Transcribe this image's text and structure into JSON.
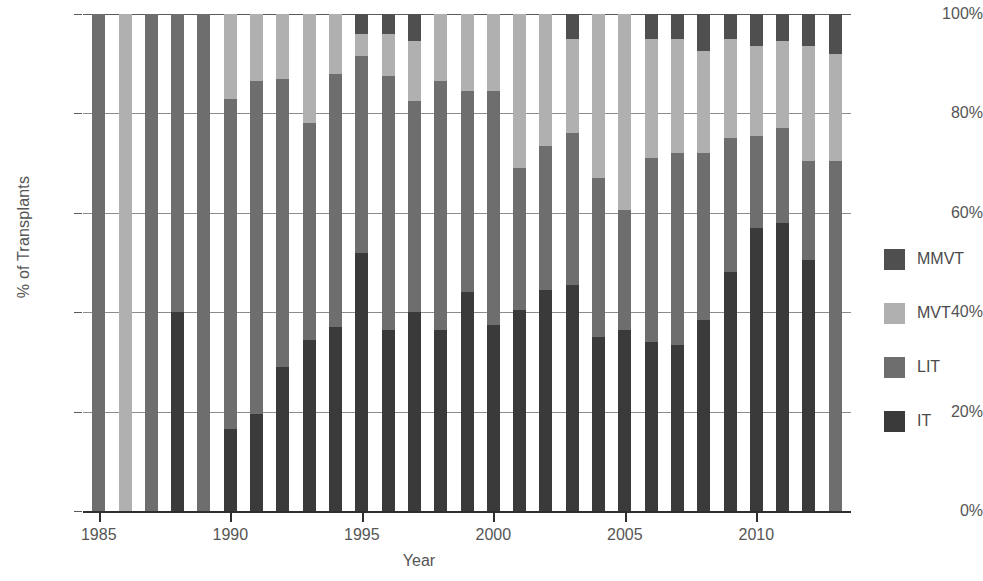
{
  "chart_data": {
    "type": "bar",
    "subtype": "stacked-percentage",
    "title": "",
    "xlabel": "Year",
    "ylabel": "% of Transplants",
    "ylim": [
      0,
      100
    ],
    "yticks": [
      0,
      20,
      40,
      60,
      80,
      100
    ],
    "ytick_labels": [
      "0%",
      "20%",
      "40%",
      "60%",
      "80%",
      "100%"
    ],
    "xticks": [
      1985,
      1990,
      1995,
      2000,
      2005,
      2010
    ],
    "xtick_labels": [
      "1985",
      "1990",
      "1995",
      "2000",
      "2005",
      "2010"
    ],
    "xlim": [
      1984.4,
      1913.0
    ],
    "x_range": [
      1984.4,
      2013.6
    ],
    "grid": "horizontal",
    "legend_position": "right",
    "stack_order_bottom_to_top": [
      "IT",
      "LIT",
      "MVT",
      "MMVT"
    ],
    "categories": [
      1985,
      1986,
      1987,
      1988,
      1989,
      1990,
      1991,
      1992,
      1993,
      1994,
      1995,
      1996,
      1997,
      1998,
      1999,
      2000,
      2001,
      2002,
      2003,
      2004,
      2005,
      2006,
      2007,
      2008,
      2009,
      2010,
      2011,
      2012,
      2013
    ],
    "series": [
      {
        "name": "IT",
        "color": "#3a3a3a",
        "values": [
          0,
          0,
          0,
          40,
          0,
          16.5,
          19.5,
          29,
          34.5,
          37,
          52,
          36.5,
          40,
          36.5,
          44,
          37.5,
          40.5,
          44.5,
          45.5,
          35,
          36.5,
          34,
          33.5,
          38.5,
          48,
          57,
          58,
          50.5,
          0
        ]
      },
      {
        "name": "LIT",
        "color": "#6e6e6e",
        "values": [
          100,
          0,
          100,
          60,
          100,
          66.5,
          67,
          58,
          43.5,
          51,
          39.5,
          51,
          42.5,
          50,
          40.5,
          47,
          28.5,
          29,
          30.5,
          32,
          24,
          37,
          38.5,
          33.5,
          27,
          18.5,
          19,
          20,
          70.5
        ]
      },
      {
        "name": "MVT",
        "color": "#b0b0b0",
        "values": [
          0,
          100,
          0,
          0,
          0,
          17,
          13.5,
          13,
          22,
          12,
          4.5,
          8.5,
          12,
          13.5,
          15.5,
          15.5,
          31,
          26.5,
          19,
          33,
          39.5,
          24,
          23,
          20.5,
          20,
          18,
          17.5,
          23,
          21.5
        ]
      },
      {
        "name": "MMVT",
        "color": "#4f4f4f",
        "values": [
          0,
          0,
          0,
          0,
          0,
          0,
          0,
          0,
          0,
          0,
          4,
          4,
          5.5,
          0,
          0,
          0,
          0,
          0,
          5,
          0,
          0,
          5,
          5,
          7.5,
          5,
          6.5,
          5.5,
          6.5,
          8
        ]
      }
    ]
  },
  "axes": {
    "y_title": "% of Transplants",
    "x_title": "Year"
  },
  "legend": {
    "items": [
      {
        "label": "MMVT",
        "color": "#4f4f4f"
      },
      {
        "label": "MVT",
        "color": "#b0b0b0"
      },
      {
        "label": "LIT",
        "color": "#6e6e6e"
      },
      {
        "label": "IT",
        "color": "#3a3a3a"
      }
    ]
  },
  "colors": {
    "background": "#ffffff",
    "gridline": "#8c8c8c",
    "axis": "#2e2e2e",
    "text": "#555555"
  }
}
